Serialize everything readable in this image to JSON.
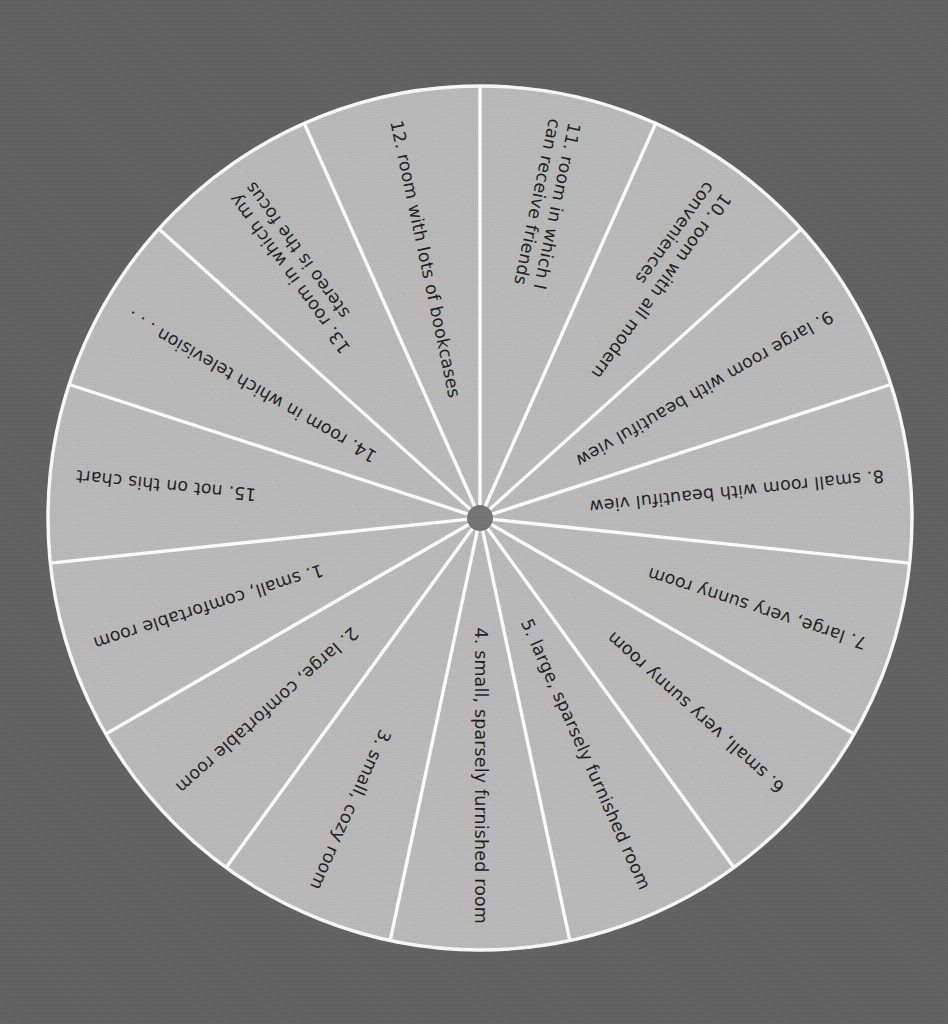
{
  "chart_data": {
    "type": "pie",
    "title": "",
    "subtitle": "",
    "xlabel": "",
    "ylabel": "",
    "legend_position": "none",
    "grid": false,
    "equal_slices": true,
    "slice_count": 15,
    "slice_value_each": 6.6667,
    "categories": [
      "1.  small, comfortable room",
      "2.  large, comfortable room",
      "3.  small, cozy room",
      "4.  small, sparsely furnished room",
      "5.  large, sparsely furnished room",
      "6.  small, very sunny room",
      "7.  large, very sunny room",
      "8.  small room with beautiful view",
      "9.  large room with beautiful view",
      "10.  room with all modern conveniences",
      "11.  room in which I can receive friends",
      "12.  room with lots of bookcases",
      "13.  room in which my stereo is the focus",
      "14.  room in which television . . .",
      "15.  not on this chart"
    ],
    "values": [
      6.6667,
      6.6667,
      6.6667,
      6.6667,
      6.6667,
      6.6667,
      6.6667,
      6.6667,
      6.6667,
      6.6667,
      6.6667,
      6.6667,
      6.6667,
      6.6667,
      6.6667
    ]
  },
  "chart": {
    "center_x": 480,
    "center_y": 518,
    "radius": 432,
    "hub_radius": 13,
    "slice_count": 15,
    "colors": {
      "background": "#606060",
      "disc": "#bdbdbd",
      "spoke": "#ffffff",
      "hub": "#737373",
      "text": "#1d1d1d"
    },
    "segments": [
      {
        "number": "1.",
        "text": "1.  small, comfortable room",
        "lines": [
          "1.  small, comfortable room"
        ],
        "flipped": false
      },
      {
        "number": "2.",
        "text": "2.  large, comfortable room",
        "lines": [
          "2.  large, comfortable room"
        ],
        "flipped": false
      },
      {
        "number": "3.",
        "text": "3.  small, cozy room",
        "lines": [
          "3.  small, cozy room"
        ],
        "flipped": false
      },
      {
        "number": "4.",
        "text": "4.  small, sparsely furnished room",
        "lines": [
          "4.  small, sparsely furnished room"
        ],
        "flipped": false
      },
      {
        "number": "5.",
        "text": "5.  large, sparsely furnished room",
        "lines": [
          "5.  large, sparsely furnished room"
        ],
        "flipped": false
      },
      {
        "number": "6.",
        "text": "6.  small, very sunny room",
        "lines": [
          "6.  small, very sunny room"
        ],
        "flipped": true
      },
      {
        "number": "7.",
        "text": "7.  large, very sunny room",
        "lines": [
          "7.  large, very sunny room"
        ],
        "flipped": true
      },
      {
        "number": "8.",
        "text": "8.  small room with beautiful view",
        "lines": [
          "8.  small room with beautiful view"
        ],
        "flipped": true
      },
      {
        "number": "9.",
        "text": "9.  large room with beautiful view",
        "lines": [
          "9.  large room with beautiful view"
        ],
        "flipped": true
      },
      {
        "number": "10.",
        "text": "10.  room with all modern conveniences",
        "lines": [
          "10.  room with all modern",
          "conveniences"
        ],
        "flipped": true
      },
      {
        "number": "11.",
        "text": "11.  room in which I can receive friends",
        "lines": [
          "11.  room in which I",
          "can receive friends"
        ],
        "flipped": true
      },
      {
        "number": "12.",
        "text": "12.  room with lots of bookcases",
        "lines": [
          "12.  room with lots of bookcases"
        ],
        "flipped": true
      },
      {
        "number": "13.",
        "text": "13.  room in which my stereo is the focus",
        "lines": [
          "13.  room in which my",
          "stereo is the focus"
        ],
        "flipped": false
      },
      {
        "number": "14.",
        "text": "14.  room in which television . . .",
        "lines": [
          "14.  room in which television . . ."
        ],
        "flipped": false
      },
      {
        "number": "15.",
        "text": "15.  not on this chart",
        "lines": [
          "15.  not on this chart"
        ],
        "flipped": false
      }
    ]
  }
}
